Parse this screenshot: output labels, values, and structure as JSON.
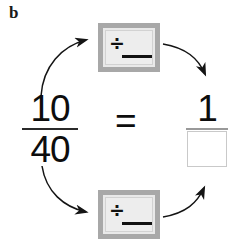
{
  "figure": {
    "part_label": "b",
    "kind": "equivalent-fraction-simplification-diagram"
  },
  "left_fraction": {
    "numerator": "10",
    "denominator": "40"
  },
  "relation": {
    "symbol": "="
  },
  "right_fraction": {
    "numerator": "1",
    "denominator_value": "",
    "denominator_placeholder": ""
  },
  "operation_boxes": [
    {
      "id": "top",
      "divide_symbol": "÷",
      "blank_value": "",
      "role": "divide-numerator"
    },
    {
      "id": "bottom",
      "divide_symbol": "÷",
      "blank_value": "",
      "role": "divide-denominator"
    }
  ],
  "arrows": [
    {
      "id": "numerator-in",
      "from": "left-fraction-numerator",
      "to": "top-operation-box"
    },
    {
      "id": "numerator-out",
      "from": "top-operation-box",
      "to": "right-fraction-numerator"
    },
    {
      "id": "denominator-in",
      "from": "left-fraction-denominator",
      "to": "bottom-operation-box"
    },
    {
      "id": "denominator-out",
      "from": "bottom-operation-box",
      "to": "right-fraction-denominator"
    }
  ],
  "colors": {
    "background": "#ffffff",
    "ink": "#0d0d0d",
    "box_border": "#a8a8a8",
    "box_fill": "#e9e9e9",
    "answer_slot_border": "#c9c9c9",
    "arrow": "#141414"
  }
}
